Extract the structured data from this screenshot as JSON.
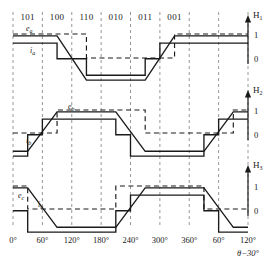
{
  "figure": {
    "stroke_color": "#1a1a1a",
    "grid_color": "#8c8c8c"
  },
  "commutation_sectors": [
    {
      "code": "101"
    },
    {
      "code": "100"
    },
    {
      "code": "110"
    },
    {
      "code": "010"
    },
    {
      "code": "011"
    },
    {
      "code": "001"
    }
  ],
  "x_axis": {
    "label": "θ−30°",
    "ticks": [
      "0°",
      "60°",
      "120°",
      "180°",
      "240°",
      "300°",
      "360°",
      "60°",
      "120°"
    ],
    "tick_degrees": [
      0,
      60,
      120,
      180,
      240,
      300,
      360,
      420,
      480
    ]
  },
  "panels": [
    {
      "hall_name": "H",
      "hall_index": "1",
      "y_ticks": [
        "1",
        "0"
      ],
      "emf_label": "e",
      "emf_sub": "a",
      "current_label": "i",
      "current_sub": "a"
    },
    {
      "hall_name": "H",
      "hall_index": "2",
      "y_ticks": [
        "1",
        "0"
      ],
      "emf_label": "e",
      "emf_sub": "b",
      "current_label": "i",
      "current_sub": "b"
    },
    {
      "hall_name": "H",
      "hall_index": "3",
      "y_ticks": [
        "1",
        "0"
      ],
      "emf_label": "e",
      "emf_sub": "c",
      "current_label": "i",
      "current_sub": "c"
    }
  ],
  "chart_data": {
    "type": "line",
    "xlabel": "θ−30°",
    "ylabel": "",
    "xlim": [
      0,
      480
    ],
    "ylim": [
      -1.25,
      1.25
    ],
    "grid": true,
    "legend": "none",
    "x_tick_values": [
      0,
      60,
      120,
      180,
      240,
      300,
      360,
      420,
      480
    ],
    "x_tick_labels": [
      "0°",
      "60°",
      "120°",
      "180°",
      "240°",
      "300°",
      "360°",
      "60°",
      "120°"
    ],
    "sector_boundaries": [
      0,
      60,
      120,
      180,
      240,
      300,
      360,
      420,
      480
    ],
    "sector_codes": [
      "101",
      "100",
      "110",
      "010",
      "011",
      "001"
    ],
    "panels": [
      {
        "name": "H1",
        "hall": {
          "style": "dashed",
          "levels": [
            1,
            0
          ],
          "points": [
            [
              0,
              1
            ],
            [
              150,
              1
            ],
            [
              150,
              0
            ],
            [
              330,
              0
            ],
            [
              330,
              1
            ],
            [
              480,
              1
            ]
          ]
        },
        "emf": {
          "name": "e_a",
          "style": "solid",
          "points": [
            [
              0,
              0.92
            ],
            [
              90,
              0.92
            ],
            [
              150,
              -0.92
            ],
            [
              270,
              -0.92
            ],
            [
              330,
              0.92
            ],
            [
              480,
              0.92
            ]
          ]
        },
        "current": {
          "name": "i_a",
          "style": "solid",
          "points": [
            [
              0,
              0.62
            ],
            [
              90,
              0.62
            ],
            [
              90,
              -0.03
            ],
            [
              150,
              -0.03
            ],
            [
              150,
              -0.72
            ],
            [
              270,
              -0.72
            ],
            [
              270,
              -0.03
            ],
            [
              300,
              -0.03
            ],
            [
              300,
              0.62
            ],
            [
              480,
              0.62
            ]
          ]
        }
      },
      {
        "name": "H2",
        "hall": {
          "style": "dashed",
          "levels": [
            1,
            0
          ],
          "points": [
            [
              0,
              0.04
            ],
            [
              90,
              0.04
            ],
            [
              90,
              1
            ],
            [
              270,
              1
            ],
            [
              270,
              0.04
            ],
            [
              450,
              0.04
            ],
            [
              450,
              1
            ],
            [
              480,
              1
            ]
          ]
        },
        "emf": {
          "name": "e_b",
          "style": "solid",
          "points": [
            [
              0,
              -0.72
            ],
            [
              30,
              -0.72
            ],
            [
              90,
              0.92
            ],
            [
              210,
              0.92
            ],
            [
              270,
              -0.72
            ],
            [
              390,
              -0.72
            ],
            [
              450,
              0.92
            ],
            [
              480,
              0.92
            ]
          ]
        },
        "current": {
          "name": "i_b",
          "style": "solid",
          "points": [
            [
              0,
              -0.92
            ],
            [
              30,
              -0.92
            ],
            [
              30,
              -0.03
            ],
            [
              60,
              -0.03
            ],
            [
              60,
              0.62
            ],
            [
              210,
              0.62
            ],
            [
              210,
              -0.03
            ],
            [
              240,
              -0.03
            ],
            [
              240,
              -0.92
            ],
            [
              390,
              -0.92
            ],
            [
              390,
              -0.03
            ],
            [
              420,
              -0.03
            ],
            [
              420,
              0.62
            ],
            [
              480,
              0.62
            ]
          ]
        }
      },
      {
        "name": "H3",
        "hall": {
          "style": "dashed",
          "levels": [
            1,
            0
          ],
          "points": [
            [
              0,
              1
            ],
            [
              30,
              1
            ],
            [
              30,
              0.04
            ],
            [
              210,
              0.04
            ],
            [
              210,
              1
            ],
            [
              390,
              1
            ],
            [
              390,
              0.04
            ],
            [
              480,
              0.04
            ]
          ]
        },
        "emf": {
          "name": "e_c",
          "style": "solid",
          "points": [
            [
              0,
              0.92
            ],
            [
              30,
              0.92
            ],
            [
              90,
              -0.72
            ],
            [
              210,
              -0.72
            ],
            [
              270,
              0.92
            ],
            [
              390,
              0.92
            ],
            [
              450,
              -0.72
            ],
            [
              480,
              -0.72
            ]
          ]
        },
        "current": {
          "name": "i_c",
          "style": "solid",
          "points": [
            [
              0,
              -0.03
            ],
            [
              30,
              -0.03
            ],
            [
              30,
              -0.92
            ],
            [
              210,
              -0.92
            ],
            [
              210,
              -0.03
            ],
            [
              240,
              -0.03
            ],
            [
              240,
              0.62
            ],
            [
              390,
              0.62
            ],
            [
              390,
              -0.03
            ],
            [
              420,
              -0.03
            ],
            [
              420,
              -0.92
            ],
            [
              480,
              -0.92
            ]
          ]
        }
      }
    ]
  }
}
